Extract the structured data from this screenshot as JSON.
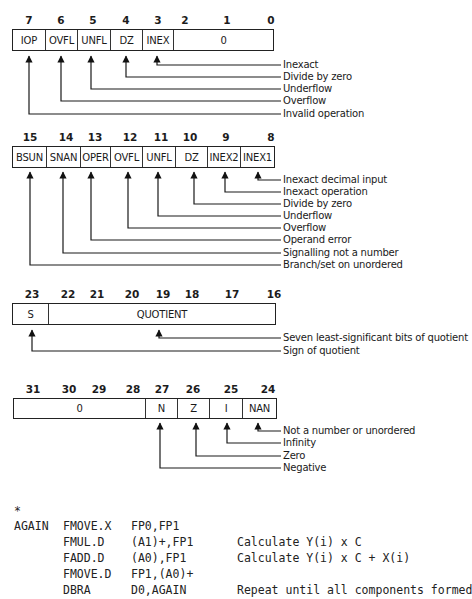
{
  "registers": [
    {
      "id": "accrued-exception-byte",
      "bits": [
        {
          "n": "7",
          "x": 29
        },
        {
          "n": "6",
          "x": 61
        },
        {
          "n": "5",
          "x": 93
        },
        {
          "n": "4",
          "x": 126
        },
        {
          "n": "3",
          "x": 158
        },
        {
          "n": "2",
          "x": 185
        },
        {
          "n": "1",
          "x": 227
        },
        {
          "n": "0",
          "x": 271
        }
      ],
      "box": {
        "x": 12,
        "y": 29,
        "w": 262,
        "h": 22
      },
      "cells": [
        {
          "label": "IOP",
          "w": 33
        },
        {
          "label": "OVFL",
          "w": 32
        },
        {
          "label": "UNFL",
          "w": 33
        },
        {
          "label": "DZ",
          "w": 32
        },
        {
          "label": "INEX",
          "w": 31
        },
        {
          "label": "0",
          "w": 101
        }
      ],
      "labels": [
        "Inexact",
        "Divide by zero",
        "Underflow",
        "Overflow",
        "Invalid operation"
      ]
    },
    {
      "id": "exception-status-byte",
      "bits": [
        {
          "n": "15",
          "x": 30
        },
        {
          "n": "14",
          "x": 64
        },
        {
          "n": "13",
          "x": 92
        },
        {
          "n": "12",
          "x": 129
        },
        {
          "n": "11",
          "x": 161
        },
        {
          "n": "10",
          "x": 190
        },
        {
          "n": "9",
          "x": 225
        },
        {
          "n": "8",
          "x": 270
        }
      ],
      "box": {
        "x": 12,
        "y": 146,
        "w": 263,
        "h": 22
      },
      "cells": [
        {
          "label": "BSUN",
          "w": 34
        },
        {
          "label": "SNAN",
          "w": 34
        },
        {
          "label": "OPER",
          "w": 30
        },
        {
          "label": "OVFL",
          "w": 32
        },
        {
          "label": "UNFL",
          "w": 33
        },
        {
          "label": "DZ",
          "w": 32
        },
        {
          "label": "INEX2",
          "w": 33
        },
        {
          "label": "INEX1",
          "w": 35
        }
      ],
      "labels": [
        "Inexact decimal input",
        "Inexact operation",
        "Divide by zero",
        "Underflow",
        "Overflow",
        "Operand error",
        "Signalling not a number",
        "Branch/set on unordered"
      ]
    },
    {
      "id": "quotient-byte",
      "bits": [
        {
          "n": "23",
          "x": 32
        },
        {
          "n": "22",
          "x": 68
        },
        {
          "n": "21",
          "x": 97
        },
        {
          "n": "20",
          "x": 132
        },
        {
          "n": "19",
          "x": 163
        },
        {
          "n": "18",
          "x": 192
        },
        {
          "n": "17",
          "x": 232
        },
        {
          "n": "16",
          "x": 274
        }
      ],
      "box": {
        "x": 12,
        "y": 303,
        "w": 264,
        "h": 22
      },
      "cells": [
        {
          "label": "S",
          "w": 36
        },
        {
          "label": "QUOTIENT",
          "w": 228
        }
      ],
      "labels": [
        "Seven least-significant bits of quotient",
        "Sign of quotient"
      ]
    },
    {
      "id": "condition-code-byte",
      "bits": [
        {
          "n": "31",
          "x": 33
        },
        {
          "n": "30",
          "x": 69
        },
        {
          "n": "29",
          "x": 99
        },
        {
          "n": "28",
          "x": 133
        },
        {
          "n": "27",
          "x": 162
        },
        {
          "n": "26",
          "x": 193
        },
        {
          "n": "25",
          "x": 231
        },
        {
          "n": "24",
          "x": 268
        }
      ],
      "box": {
        "x": 13,
        "y": 398,
        "w": 264,
        "h": 21
      },
      "cells": [
        {
          "label": "0",
          "w": 132
        },
        {
          "label": "N",
          "w": 32
        },
        {
          "label": "Z",
          "w": 32
        },
        {
          "label": "I",
          "w": 33
        },
        {
          "label": "NAN",
          "w": 35
        }
      ],
      "labels": [
        "Not a number or unordered",
        "Infinity",
        "Zero",
        "Negative"
      ]
    }
  ],
  "code": {
    "comment_marker": "*",
    "lines": [
      {
        "label": "AGAIN",
        "op": "FMOVE.X",
        "args": "FP0,FP1",
        "comment": ""
      },
      {
        "label": "",
        "op": "FMUL.D",
        "args": "(A1)+,FP1",
        "comment": "Calculate Y(i) x C"
      },
      {
        "label": "",
        "op": "FADD.D",
        "args": "(A0),FP1",
        "comment": "Calculate Y(i) x C + X(i)"
      },
      {
        "label": "",
        "op": "FMOVE.D",
        "args": "FP1,(A0)+",
        "comment": ""
      },
      {
        "label": "",
        "op": "DBRA",
        "args": "D0,AGAIN",
        "comment": "Repeat until all components formed"
      }
    ]
  }
}
